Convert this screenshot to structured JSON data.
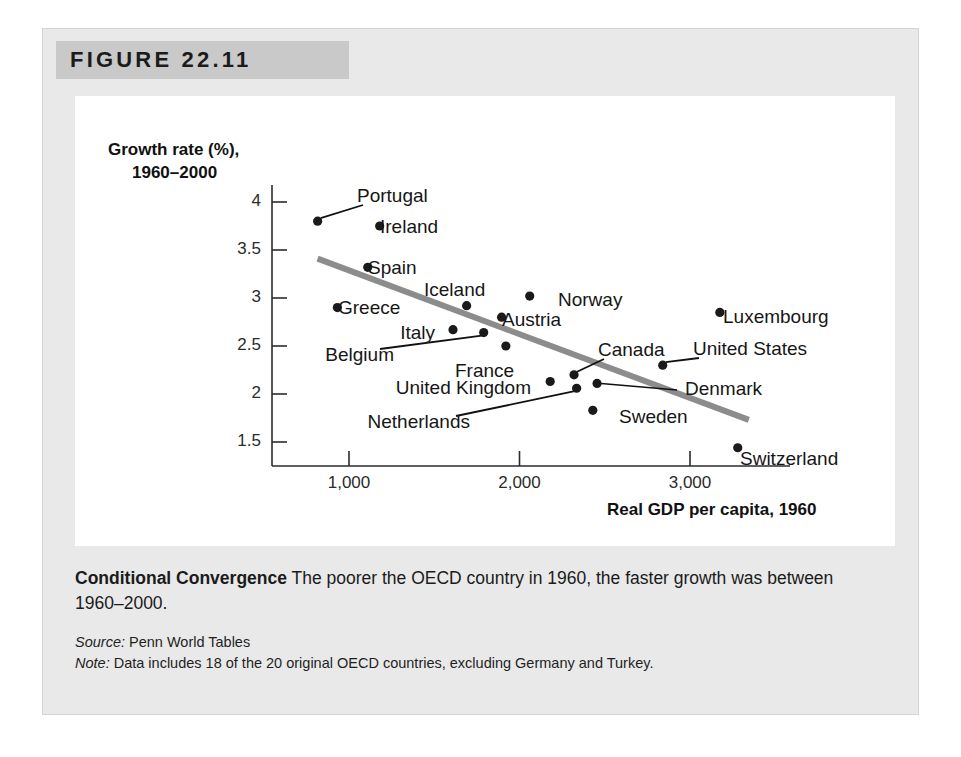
{
  "figure": {
    "number_label": "FIGURE 22.11"
  },
  "caption": {
    "title": "Conditional Convergence",
    "body": " The poorer the OECD country in 1960, the faster growth was between 1960–2000.",
    "source_label": "Source:",
    "source_text": " Penn World Tables",
    "note_label": "Note:",
    "note_text": " Data includes 18 of the 20 original OECD countries, excluding Germany and Turkey."
  },
  "chart_data": {
    "type": "scatter",
    "title": "",
    "xlabel": "Real GDP per capita, 1960",
    "ylabel": "Growth rate (%), 1960–2000",
    "ylabel_line1": "Growth rate (%),",
    "ylabel_line2": "1960–2000",
    "grid": false,
    "legend": "none",
    "xlim": [
      600,
      3400
    ],
    "ylim": [
      1.3,
      4.15
    ],
    "xticks": [
      1000,
      2000,
      3000
    ],
    "xtick_labels": [
      "1,000",
      "2,000",
      "3,000"
    ],
    "yticks": [
      1.5,
      2,
      2.5,
      3,
      3.5,
      4
    ],
    "ytick_labels": [
      "1.5",
      "2",
      "2.5",
      "3",
      "3.5",
      "4"
    ],
    "points": [
      {
        "name": "Portugal",
        "x": 816,
        "y": 3.8,
        "label_pos": "leader-up-right",
        "label_x": 357,
        "label_y": 197
      },
      {
        "name": "Ireland",
        "x": 1180,
        "y": 3.75,
        "label_pos": "right",
        "label_x": 380,
        "label_y": 228
      },
      {
        "name": "Spain",
        "x": 1110,
        "y": 3.32,
        "label_pos": "right",
        "label_x": 368,
        "label_y": 269
      },
      {
        "name": "Greece",
        "x": 932,
        "y": 2.9,
        "label_pos": "right",
        "label_x": 338,
        "label_y": 309
      },
      {
        "name": "Iceland",
        "x": 1690,
        "y": 2.92,
        "label_pos": "above",
        "label_x": 424,
        "label_y": 291
      },
      {
        "name": "Austria",
        "x": 1895,
        "y": 2.8,
        "label_pos": "right",
        "label_x": 502,
        "label_y": 321
      },
      {
        "name": "Norway",
        "x": 2060,
        "y": 3.02,
        "label_pos": "right",
        "label_x": 558,
        "label_y": 301
      },
      {
        "name": "Italy",
        "x": 1610,
        "y": 2.67,
        "label_pos": "left",
        "label_x": 435,
        "label_y": 334
      },
      {
        "name": "Belgium",
        "x": 1790,
        "y": 2.64,
        "label_pos": "leader-down-left",
        "label_x": 394,
        "label_y": 356
      },
      {
        "name": "France",
        "x": 1920,
        "y": 2.5,
        "label_pos": "below",
        "label_x": 455,
        "label_y": 372
      },
      {
        "name": "United Kingdom",
        "x": 2180,
        "y": 2.13,
        "label_pos": "left",
        "label_x": 531,
        "label_y": 389
      },
      {
        "name": "Canada",
        "x": 2320,
        "y": 2.2,
        "label_pos": "leader-up-right",
        "label_x": 598,
        "label_y": 351
      },
      {
        "name": "Netherlands",
        "x": 2335,
        "y": 2.06,
        "label_pos": "leader-down-left",
        "label_x": 470,
        "label_y": 423
      },
      {
        "name": "Denmark",
        "x": 2455,
        "y": 2.11,
        "label_pos": "leader-right",
        "label_x": 685,
        "label_y": 390
      },
      {
        "name": "Sweden",
        "x": 2430,
        "y": 1.83,
        "label_pos": "right",
        "label_x": 619,
        "label_y": 418
      },
      {
        "name": "United States",
        "x": 2840,
        "y": 2.3,
        "label_pos": "leader-up-right",
        "label_x": 693,
        "label_y": 350
      },
      {
        "name": "Luxembourg",
        "x": 3175,
        "y": 2.85,
        "label_pos": "right",
        "label_x": 723,
        "label_y": 318
      },
      {
        "name": "Switzerland",
        "x": 3280,
        "y": 1.44,
        "label_pos": "right",
        "label_x": 740,
        "label_y": 460
      }
    ],
    "trendline": {
      "x1": 816,
      "y1": 3.41,
      "x2": 3345,
      "y2": 1.73,
      "color": "#8c8c8c",
      "width": 6
    },
    "point_color": "#1a1a1a",
    "axis_color": "#2b2b2b"
  }
}
